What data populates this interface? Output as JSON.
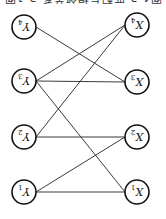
{
  "figure": {
    "orientation": "rotated-180",
    "caption_partial": "图4-3 匹配与相邻关系 3-1图"
  },
  "diagram": {
    "type": "bipartite-graph",
    "left_column": [
      {
        "id": "Y4",
        "label": "Y",
        "sub": "4",
        "x": 24,
        "y": 27
      },
      {
        "id": "Y3",
        "label": "Y",
        "sub": "3",
        "x": 24,
        "y": 81
      },
      {
        "id": "Y2",
        "label": "Y",
        "sub": "2",
        "x": 24,
        "y": 137
      },
      {
        "id": "Y1",
        "label": "Y",
        "sub": "1",
        "x": 24,
        "y": 192
      }
    ],
    "right_column": [
      {
        "id": "X4",
        "label": "X",
        "sub": "4",
        "x": 137,
        "y": 25
      },
      {
        "id": "X3",
        "label": "X",
        "sub": "3",
        "x": 137,
        "y": 82
      },
      {
        "id": "X2",
        "label": "X",
        "sub": "2",
        "x": 137,
        "y": 137
      },
      {
        "id": "X1",
        "label": "X",
        "sub": "1",
        "x": 137,
        "y": 192
      }
    ],
    "edges": [
      [
        "Y4",
        "X3"
      ],
      [
        "Y3",
        "X4"
      ],
      [
        "Y3",
        "X3"
      ],
      [
        "Y3",
        "X1"
      ],
      [
        "Y2",
        "X4"
      ],
      [
        "Y2",
        "X2"
      ],
      [
        "Y1",
        "X2"
      ],
      [
        "Y1",
        "X1"
      ]
    ],
    "node_radius": 12
  }
}
